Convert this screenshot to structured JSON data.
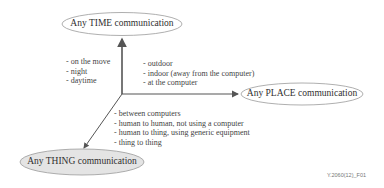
{
  "diagram": {
    "nodes": {
      "time": {
        "label": "Any TIME communication",
        "fill": "#ffffff",
        "stroke": "#9a9a9a"
      },
      "place": {
        "label": "Any PLACE communication",
        "fill": "#ffffff",
        "stroke": "#9a9a9a"
      },
      "thing": {
        "label": "Any THING communication",
        "fill": "#e4e4e4",
        "stroke": "#9a9a9a"
      }
    },
    "time_items": [
      "- on the move",
      "- night",
      "- daytime"
    ],
    "place_items": [
      "- outdoor",
      "- indoor (away from the computer)",
      "- at the computer"
    ],
    "thing_items": [
      "- between computers",
      "- human to human, not using a computer",
      "- human to thing, using generic equipment",
      "- thing to thing"
    ],
    "axis_color": "#555555",
    "caption": "Y.2060(12)_F01"
  }
}
